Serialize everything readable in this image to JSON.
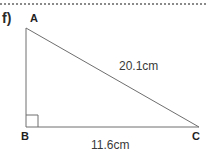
{
  "page": {
    "width": 206,
    "height": 167,
    "background_color": "#ffffff",
    "top_rule": {
      "style": "dotted",
      "color": "#8a8a8a"
    }
  },
  "question": {
    "part_label": "f)"
  },
  "figure": {
    "type": "right-triangle",
    "stroke_color": "#6e6e6e",
    "stroke_width": 1,
    "right_angle_vertex": "B",
    "vertices": [
      {
        "name": "A",
        "label": "A",
        "x": 26,
        "y": 28
      },
      {
        "name": "B",
        "label": "B",
        "x": 26,
        "y": 127
      },
      {
        "name": "C",
        "label": "C",
        "x": 199,
        "y": 127
      }
    ],
    "right_angle_marker": {
      "at": "B",
      "size": 12
    },
    "sides": [
      {
        "name": "hypotenuse-AC",
        "from": "A",
        "to": "C",
        "label": "20.1cm",
        "value": 20.1,
        "unit": "cm"
      },
      {
        "name": "base-BC",
        "from": "B",
        "to": "C",
        "label": "11.6cm",
        "value": 11.6,
        "unit": "cm"
      },
      {
        "name": "vertical-AB",
        "from": "A",
        "to": "B",
        "label": "",
        "value": null,
        "unit": "cm"
      }
    ]
  }
}
